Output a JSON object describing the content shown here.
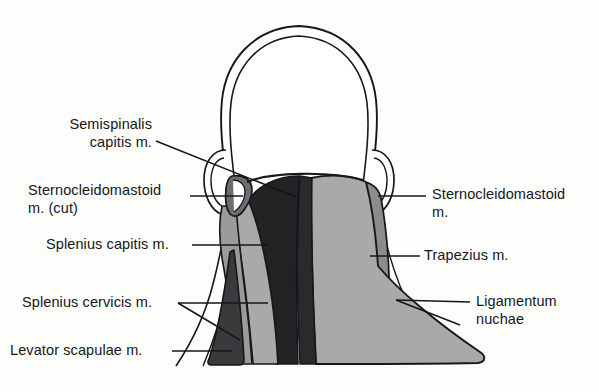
{
  "figure": {
    "background_color": "#fdfdfc",
    "line_color": "#15171a"
  },
  "palette": {
    "outline": "#15171a",
    "skin": "#ffffff",
    "semispinalis_capitis": "#232326",
    "sternocleidomastoid_cut": "#6d6d70",
    "splenius_capitis": "#a9a9a9",
    "splenius_cervicis": "#9b9b9b",
    "levator_scapulae": "#3a3a3c",
    "trapezius": "#a9a9a9",
    "ligamentum_nuchae": "#2a2a2d",
    "sternocleidomastoid": "#8c8c8f"
  },
  "labels": {
    "semispinalis_capitis": "Semispinalis\ncapitis m.",
    "sternocleidomastoid_cut": "Sternocleidomastoid\nm. (cut)",
    "splenius_capitis": "Splenius capitis m.",
    "splenius_cervicis": "Splenius cervicis m.",
    "levator_scapulae": "Levator scapulae m.",
    "sternocleidomastoid": "Sternocleidomastoid\nm.",
    "trapezius": "Trapezius m.",
    "ligamentum_nuchae": "Ligamentum\nnuchae"
  },
  "label_positions": {
    "semispinalis_capitis": {
      "x": 52,
      "y": 116,
      "align": "right",
      "width": 100
    },
    "sternocleidomastoid_cut": {
      "x": 28,
      "y": 182,
      "align": "leftblock",
      "width": 160
    },
    "splenius_capitis": {
      "x": 46,
      "y": 236,
      "align": "leftblock",
      "width": 138
    },
    "splenius_cervicis": {
      "x": 22,
      "y": 299,
      "align": "leftblock",
      "width": 152
    },
    "levator_scapulae": {
      "x": 10,
      "y": 341,
      "align": "leftblock",
      "width": 158
    },
    "sternocleidomastoid": {
      "x": 432,
      "y": 186,
      "align": "right",
      "width": 160
    },
    "trapezius": {
      "x": 424,
      "y": 247,
      "align": "right",
      "width": 120
    },
    "ligamentum_nuchae": {
      "x": 476,
      "y": 293,
      "align": "right",
      "width": 110
    }
  }
}
